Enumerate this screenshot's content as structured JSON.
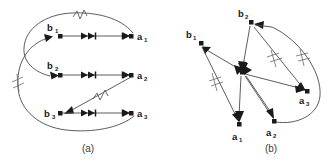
{
  "figure": {
    "background_color": "#ffffff",
    "line_color": "#4a4a4a",
    "node_color": "#1a1a1a",
    "width": 336,
    "height": 165
  },
  "panels": [
    {
      "id": "panel-a",
      "caption": "(a)",
      "caption_x": 88,
      "caption_y": 150,
      "layout": "bipartite-rows",
      "nodes": [
        {
          "id": "b1",
          "label": "b",
          "subscript": "1",
          "x": 60,
          "y": 36,
          "label_x": 50,
          "label_y": 27
        },
        {
          "id": "b2",
          "label": "b",
          "subscript": "2",
          "x": 60,
          "y": 75,
          "label_x": 50,
          "label_y": 65
        },
        {
          "id": "b3",
          "label": "b",
          "subscript": "3",
          "x": 60,
          "y": 113,
          "label_x": 46,
          "label_y": 117
        },
        {
          "id": "a1",
          "label": "a",
          "subscript": "1",
          "x": 132,
          "y": 36,
          "label_x": 137,
          "label_y": 40
        },
        {
          "id": "a2",
          "label": "a",
          "subscript": "2",
          "x": 132,
          "y": 75,
          "label_x": 137,
          "label_y": 79
        },
        {
          "id": "a3",
          "label": "a",
          "subscript": "3",
          "x": 132,
          "y": 113,
          "label_x": 137,
          "label_y": 117
        }
      ],
      "edges": [
        {
          "id": "a-e1",
          "from": "b1",
          "to": "a1",
          "kind": "straight",
          "markers": [
            "mid-double",
            "end-arrow"
          ]
        },
        {
          "id": "a-e2",
          "from": "b2",
          "to": "a2",
          "kind": "straight",
          "markers": [
            "mid-double",
            "end-arrow"
          ]
        },
        {
          "id": "a-e3",
          "from": "b3",
          "to": "a3",
          "kind": "straight",
          "markers": [
            "mid-double",
            "end-arrow"
          ]
        },
        {
          "id": "a-e4",
          "from": "a1",
          "to": "b2",
          "kind": "curve-top",
          "markers": [
            "end-arrow"
          ],
          "tick": "zigzag-top"
        },
        {
          "id": "a-e5",
          "from": "a3",
          "to": "b1",
          "kind": "curve-left",
          "markers": [
            "end-arrow"
          ],
          "tick": "slash-left"
        },
        {
          "id": "a-e6",
          "from": "a2",
          "to": "b3",
          "kind": "diagonal",
          "markers": [
            "end-arrow"
          ],
          "tick": "zigzag-diag"
        }
      ]
    },
    {
      "id": "panel-b",
      "caption": "(b)",
      "caption_x": 271,
      "caption_y": 150,
      "layout": "radial-hub",
      "nodes": [
        {
          "id": "b1",
          "label": "b",
          "subscript": "1",
          "x": 201,
          "y": 43,
          "label_x": 188,
          "label_y": 36
        },
        {
          "id": "b2",
          "label": "b",
          "subscript": "2",
          "x": 251,
          "y": 22,
          "label_x": 240,
          "label_y": 16
        },
        {
          "id": "hub",
          "label": "",
          "subscript": "",
          "x": 242,
          "y": 72,
          "label_x": 0,
          "label_y": 0
        },
        {
          "id": "a1",
          "label": "a",
          "subscript": "1",
          "x": 239,
          "y": 124,
          "label_x": 234,
          "label_y": 138
        },
        {
          "id": "a2",
          "label": "a",
          "subscript": "2",
          "x": 274,
          "y": 121,
          "label_x": 268,
          "label_y": 134
        },
        {
          "id": "a3",
          "label": "a",
          "subscript": "3",
          "x": 307,
          "y": 91,
          "label_x": 300,
          "label_y": 103
        }
      ],
      "edges": [
        {
          "id": "b-e1",
          "from": "b2",
          "to": "hub",
          "kind": "straight",
          "markers": [
            "end-arrow"
          ]
        },
        {
          "id": "b-e2",
          "from": "hub",
          "to": "a1",
          "kind": "straight",
          "markers": [
            "end-arrow"
          ]
        },
        {
          "id": "b-e3",
          "from": "hub",
          "to": "a2",
          "kind": "straight",
          "markers": [
            "end-arrow"
          ]
        },
        {
          "id": "b-e4",
          "from": "hub",
          "to": "a3",
          "kind": "straight",
          "markers": [
            "end-arrow"
          ]
        },
        {
          "id": "b-e5",
          "from": "hub",
          "to": "b1",
          "kind": "straight",
          "markers": [
            "end-arrow"
          ]
        },
        {
          "id": "b-e6",
          "from": "b1",
          "to": "a1",
          "kind": "straight",
          "markers": [
            "end-arrow"
          ],
          "tick": "slash"
        },
        {
          "id": "b-e7",
          "from": "b2",
          "to": "a3",
          "kind": "straight",
          "markers": [
            "end-arrow"
          ],
          "tick": "slash"
        },
        {
          "id": "b-e8",
          "from": "a2",
          "to": "b2",
          "kind": "curve-right",
          "markers": [
            "end-arrow"
          ],
          "tick": "slash"
        }
      ]
    }
  ]
}
